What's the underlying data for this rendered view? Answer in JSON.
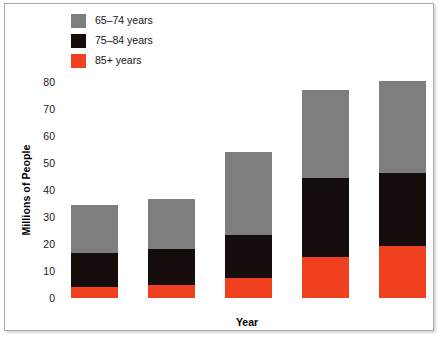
{
  "chart_data": {
    "type": "bar",
    "subtype": "stacked-vertical",
    "title": "",
    "xlabel": "Year",
    "ylabel": "Millions of People",
    "categories": [
      "2000",
      "2005",
      "2020",
      "2040",
      "2050"
    ],
    "ylim": [
      0,
      80
    ],
    "yticks": [
      0,
      10,
      20,
      30,
      40,
      50,
      60,
      70,
      80
    ],
    "ytick_labels": [
      "0",
      "10",
      "20",
      "30",
      "40",
      "50",
      "60",
      "70",
      "80"
    ],
    "grid": false,
    "legend_position": "top-left",
    "series": [
      {
        "name": "85+ years",
        "color": "#f0401f",
        "values": [
          4.0,
          4.8,
          7.4,
          15.2,
          19.3
        ]
      },
      {
        "name": "75-84 years",
        "color": "#150d0c",
        "values": [
          12.7,
          13.3,
          15.9,
          29.2,
          27.0
        ]
      },
      {
        "name": "65-74 years",
        "color": "#7e7e7e",
        "values": [
          17.7,
          18.6,
          30.7,
          32.6,
          34.2
        ]
      }
    ],
    "totals": [
      34.4,
      36.7,
      54.0,
      77.0,
      80.5
    ]
  },
  "legend": {
    "items": [
      {
        "label": "65–74 years",
        "color": "#7e7e7e",
        "swatch_name": "legend-swatch-65-74"
      },
      {
        "label": "75–84 years",
        "color": "#150d0c",
        "swatch_name": "legend-swatch-75-84"
      },
      {
        "label": "85+ years",
        "color": "#f0401f",
        "swatch_name": "legend-swatch-85-plus"
      }
    ]
  },
  "axes": {
    "y_title": "Millions of People",
    "x_title": "Year"
  },
  "colors": {
    "gray": "#7e7e7e",
    "black": "#150d0c",
    "red": "#f0401f",
    "frame": "#a8a8a8",
    "background": "#ffffff",
    "text": "#141414"
  }
}
